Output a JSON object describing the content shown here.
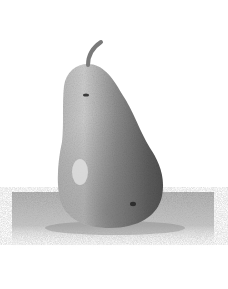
{
  "image": {
    "subject": "Pencil drawing of a pear",
    "description": "Grayscale graphite sketch of a single pear with a stem, resting on a hatched surface with a cast shadow",
    "colors": {
      "background": "#ffffff",
      "pear_light": "#c9c9c9",
      "pear_mid": "#8e8e8e",
      "pear_dark": "#5a5a5a",
      "stem": "#7a7a7a",
      "ground": "#a8a8a8",
      "spot": "#2e2e2e"
    }
  }
}
